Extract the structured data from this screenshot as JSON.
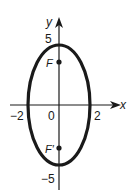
{
  "diagram": {
    "type": "ellipse-graph",
    "axes": {
      "x_label": "x",
      "y_label": "y",
      "x_ticks": [
        "−2",
        "0",
        "2"
      ],
      "y_ticks": [
        "5",
        "−5"
      ]
    },
    "ellipse": {
      "center": [
        0,
        0
      ],
      "semi_major_vertical": 5,
      "semi_minor_horizontal": 2
    },
    "foci": [
      {
        "label": "F",
        "position": "upper"
      },
      {
        "label": "F′",
        "position": "lower"
      }
    ],
    "colors": {
      "stroke": "#1a1a1a",
      "background": "#ffffff"
    }
  }
}
